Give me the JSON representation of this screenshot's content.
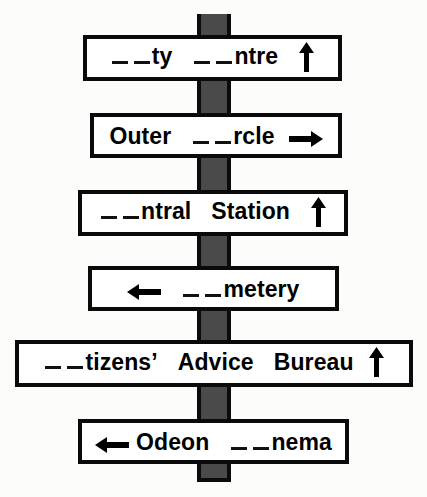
{
  "scene": {
    "description": "Photograph of a multi-armed street signpost with six white rectangular direction signs mounted on a dark grey vertical post. Each sign has its first letters replaced by blanks.",
    "background_color": "#fcfcfb",
    "post_color": "#4a4a4a",
    "post_outline_color": "#0a0a0a",
    "sign_fill_color": "#ffffff",
    "sign_border_color": "#0a0a0a",
    "text_color": "#000000"
  },
  "signs": [
    {
      "id": "sign-1",
      "full_text": "__ ty __ ntre ↑",
      "segments": [
        {
          "type": "blank"
        },
        {
          "type": "text",
          "value": "ty"
        },
        {
          "type": "gap",
          "size": "lg"
        },
        {
          "type": "blank"
        },
        {
          "type": "text",
          "value": "ntre"
        },
        {
          "type": "gap",
          "size": "lg"
        },
        {
          "type": "arrow",
          "direction": "up"
        }
      ],
      "arrow": "up",
      "words": [
        "ty",
        "ntre"
      ]
    },
    {
      "id": "sign-2",
      "full_text": "Outer __ rcle →",
      "segments": [
        {
          "type": "text",
          "value": "Outer"
        },
        {
          "type": "gap",
          "size": "lg"
        },
        {
          "type": "blank"
        },
        {
          "type": "text",
          "value": "rcle"
        },
        {
          "type": "gap",
          "size": "md"
        },
        {
          "type": "arrow",
          "direction": "right"
        }
      ],
      "arrow": "right",
      "words": [
        "Outer",
        "rcle"
      ]
    },
    {
      "id": "sign-3",
      "full_text": "__ ntral Station ↑",
      "segments": [
        {
          "type": "blank"
        },
        {
          "type": "text",
          "value": "ntral"
        },
        {
          "type": "gap",
          "size": "lg"
        },
        {
          "type": "text",
          "value": "Station"
        },
        {
          "type": "gap",
          "size": "lg"
        },
        {
          "type": "arrow",
          "direction": "up"
        }
      ],
      "arrow": "up",
      "words": [
        "ntral",
        "Station"
      ]
    },
    {
      "id": "sign-4",
      "full_text": "← __ metery",
      "segments": [
        {
          "type": "arrow",
          "direction": "left"
        },
        {
          "type": "gap",
          "size": "lg"
        },
        {
          "type": "blank"
        },
        {
          "type": "text",
          "value": "metery"
        }
      ],
      "arrow": "left",
      "words": [
        "metery"
      ]
    },
    {
      "id": "sign-5",
      "full_text": "__ tizens' Advice Bureau ↑",
      "segments": [
        {
          "type": "blank"
        },
        {
          "type": "text",
          "value": "tizens’"
        },
        {
          "type": "gap",
          "size": "lg"
        },
        {
          "type": "text",
          "value": "Advice"
        },
        {
          "type": "gap",
          "size": "lg"
        },
        {
          "type": "text",
          "value": "Bureau"
        },
        {
          "type": "gap",
          "size": "md"
        },
        {
          "type": "arrow",
          "direction": "up"
        }
      ],
      "arrow": "up",
      "words": [
        "tizens’",
        "Advice",
        "Bureau"
      ]
    },
    {
      "id": "sign-6",
      "full_text": "← Odeon __ nema",
      "segments": [
        {
          "type": "arrow",
          "direction": "left"
        },
        {
          "type": "gap",
          "size": "sm"
        },
        {
          "type": "text",
          "value": "Odeon"
        },
        {
          "type": "gap",
          "size": "lg"
        },
        {
          "type": "blank"
        },
        {
          "type": "text",
          "value": "nema"
        }
      ],
      "arrow": "left",
      "words": [
        "Odeon",
        "nema"
      ]
    }
  ]
}
